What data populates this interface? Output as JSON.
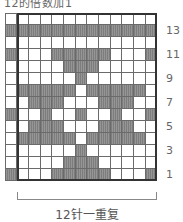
{
  "title": "12的倍数加1",
  "caption": "12针一重复",
  "colors": {
    "dark": "#888888",
    "light": "#ffffff",
    "border": "#333333"
  },
  "grid": {
    "columns": 13,
    "repeat_columns": 12,
    "rows_top_to_bottom": [
      {
        "row": 14,
        "dark": []
      },
      {
        "row": 13,
        "dark": [
          0,
          1,
          2,
          3,
          4,
          5,
          6,
          7,
          8,
          9,
          10,
          11,
          12
        ]
      },
      {
        "row": 12,
        "dark": []
      },
      {
        "row": 11,
        "dark": [
          0,
          4,
          5,
          6,
          7,
          8,
          12
        ]
      },
      {
        "row": 10,
        "dark": [
          5,
          6,
          7
        ]
      },
      {
        "row": 9,
        "dark": [
          6
        ]
      },
      {
        "row": 8,
        "dark": [
          1,
          2,
          3,
          4,
          5,
          7,
          8,
          9,
          10,
          11
        ]
      },
      {
        "row": 7,
        "dark": [
          2,
          3,
          4,
          8,
          9,
          10
        ]
      },
      {
        "row": 6,
        "dark": [
          0,
          3,
          6,
          9,
          12
        ]
      },
      {
        "row": 5,
        "dark": [
          2,
          3,
          4,
          8,
          9,
          10
        ]
      },
      {
        "row": 4,
        "dark": [
          1,
          2,
          3,
          4,
          5,
          7,
          8,
          9,
          10,
          11
        ]
      },
      {
        "row": 3,
        "dark": [
          6
        ]
      },
      {
        "row": 2,
        "dark": [
          5,
          6,
          7
        ]
      },
      {
        "row": 1,
        "dark": [
          0,
          4,
          5,
          6,
          7,
          8,
          12
        ]
      }
    ]
  },
  "row_labels": [
    {
      "label": "13",
      "row": 13
    },
    {
      "label": "11",
      "row": 11
    },
    {
      "label": "9",
      "row": 9
    },
    {
      "label": "7",
      "row": 7
    },
    {
      "label": "5",
      "row": 5
    },
    {
      "label": "3",
      "row": 3
    },
    {
      "label": "1",
      "row": 1
    }
  ]
}
